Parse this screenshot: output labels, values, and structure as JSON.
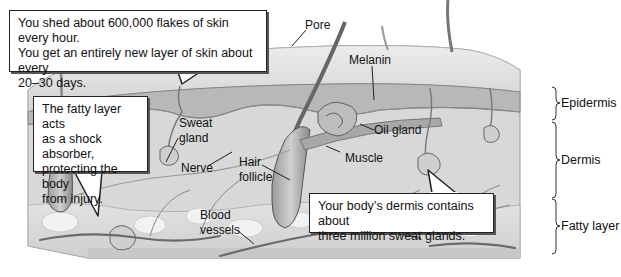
{
  "diagram": {
    "callouts": [
      {
        "id": "shed",
        "lines": [
          "You shed about 600,000 flakes of skin every hour.",
          "You get an entirely new layer of skin about every",
          "20–30 days."
        ]
      },
      {
        "id": "fatty",
        "lines": [
          "The fatty layer acts",
          "as a shock absorber,",
          "protecting the body",
          "from injury."
        ]
      },
      {
        "id": "dermis",
        "lines": [
          "Your body’s dermis contains about",
          "three million sweat glands."
        ]
      }
    ],
    "structure_labels": {
      "pore": "Pore",
      "melanin": "Melanin",
      "oil_gland": "Oil gland",
      "sweat_gland_1": "Sweat",
      "sweat_gland_2": "gland",
      "nerve": "Nerve",
      "hair_follicle_1": "Hair",
      "hair_follicle_2": "follicle",
      "muscle": "Muscle",
      "blood_vessels_1": "Blood",
      "blood_vessels_2": "vessels"
    },
    "layers": [
      {
        "name": "Epidermis"
      },
      {
        "name": "Dermis"
      },
      {
        "name": "Fatty layer"
      }
    ],
    "colors": {
      "epidermis_top": "#e4e4e4",
      "epidermis_band": "#bdbdbd",
      "dermis": "#d9d9d9",
      "fat": "#e8e8e8",
      "lines": "#555555",
      "vessel": "#6a6a6a"
    }
  }
}
